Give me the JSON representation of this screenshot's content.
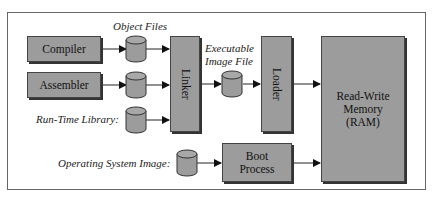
{
  "diagram": {
    "labels": {
      "object_files": "Object Files",
      "executable_image_file_line1": "Executable",
      "executable_image_file_line2": "Image File",
      "run_time_library": "Run-Time Library:",
      "operating_system_image": "Operating System Image:"
    },
    "boxes": {
      "compiler": "Compiler",
      "assembler": "Assembler",
      "linker": "Linker",
      "loader": "Loader",
      "boot_line1": "Boot",
      "boot_line2": "Process",
      "ram_line1": "Read-Write",
      "ram_line2": "Memory",
      "ram_line3": "(RAM)"
    },
    "colors": {
      "box_fill": "#9c9c9c",
      "border": "#444444",
      "frame": "#666666"
    }
  }
}
